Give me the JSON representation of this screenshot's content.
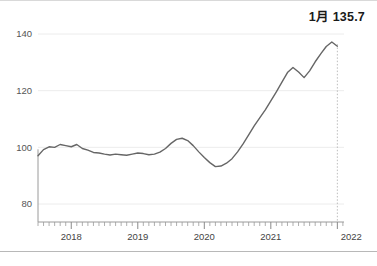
{
  "annotation": {
    "label": "1月 135.7"
  },
  "chart_data": {
    "type": "line",
    "title": "",
    "subtitle": "",
    "xlabel": "",
    "ylabel": "",
    "ylim": [
      75,
      145
    ],
    "xlim": [
      2017.5,
      2022.1
    ],
    "grid": true,
    "legend_position": "none",
    "line_color": "#666666",
    "gridline_color": "#ececec",
    "axis_color": "#9a9a9a",
    "marker_line_color": "#bdbdbd",
    "ytick_labels": [
      "140",
      "120",
      "100",
      "80"
    ],
    "ytick_values": [
      140,
      120,
      100,
      80
    ],
    "xtick_labels": [
      "2018",
      "2019",
      "2020",
      "2021",
      "2022"
    ],
    "xtick_values": [
      2018,
      2019,
      2020,
      2021,
      2022
    ],
    "minor_tick_interval_months": 1,
    "annotation_point": {
      "label": "1月 135.7",
      "x": 2022.0,
      "y": 135.7
    },
    "series": [
      {
        "name": "index",
        "x": [
          2017.5,
          2017.583,
          2017.667,
          2017.75,
          2017.833,
          2017.917,
          2018.0,
          2018.083,
          2018.167,
          2018.25,
          2018.333,
          2018.417,
          2018.5,
          2018.583,
          2018.667,
          2018.75,
          2018.833,
          2018.917,
          2019.0,
          2019.083,
          2019.167,
          2019.25,
          2019.333,
          2019.417,
          2019.5,
          2019.583,
          2019.667,
          2019.75,
          2019.833,
          2019.917,
          2020.0,
          2020.083,
          2020.167,
          2020.25,
          2020.333,
          2020.417,
          2020.5,
          2020.583,
          2020.667,
          2020.75,
          2020.833,
          2020.917,
          2021.0,
          2021.083,
          2021.167,
          2021.25,
          2021.333,
          2021.417,
          2021.5,
          2021.583,
          2021.667,
          2021.75,
          2021.833,
          2021.917,
          2022.0
        ],
        "values": [
          97.0,
          99.2,
          100.2,
          100.0,
          101.0,
          100.6,
          100.2,
          101.0,
          99.6,
          99.0,
          98.2,
          98.0,
          97.6,
          97.3,
          97.6,
          97.4,
          97.2,
          97.6,
          98.0,
          97.8,
          97.4,
          97.6,
          98.3,
          99.6,
          101.4,
          102.8,
          103.2,
          102.4,
          100.6,
          98.4,
          96.4,
          94.6,
          93.2,
          93.4,
          94.4,
          96.0,
          98.4,
          101.2,
          104.4,
          107.6,
          110.4,
          113.2,
          116.4,
          119.6,
          123.0,
          126.4,
          128.2,
          126.6,
          124.6,
          127.0,
          130.2,
          133.0,
          135.6,
          137.2,
          135.7
        ]
      }
    ]
  }
}
